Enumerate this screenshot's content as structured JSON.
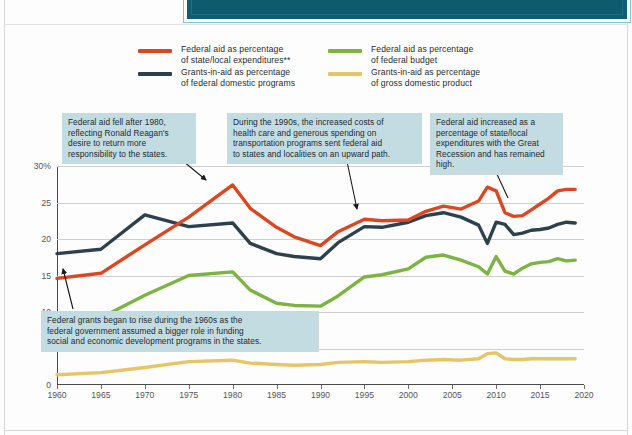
{
  "header": {
    "banner_text": "Figure • Federal aid to state and local governments, 1960-2020"
  },
  "legend": {
    "items": [
      {
        "name": "federal-aid-state-local",
        "label": "Federal aid as percentage\nof state/local expenditures**",
        "color": "#dc4620"
      },
      {
        "name": "federal-aid-federal-budget",
        "label": "Federal aid as percentage\nof federal budget",
        "color": "#7cb342"
      },
      {
        "name": "grants-in-aid-federal-domestic",
        "label": "Grants-in-aid as percentage\nof federal domestic programs",
        "color": "#2c404d"
      },
      {
        "name": "grants-in-aid-gdp",
        "label": "Grants-in-aid as percentage\nof gross domestic product",
        "color": "#e8c468"
      }
    ]
  },
  "annotations": {
    "reagan": "Federal aid fell after 1980,\nreflecting Ronald Reagan's\ndesire to return more\nresponsibility to the states.",
    "nineties": "During the 1990s, the increased costs of\nhealth care and generous spending on\ntransportation programs sent federal aid\nto states and localities on an upward path.",
    "recession": "Federal aid increased as a\npercentage of state/local\nexpenditures with the Great\nRecession and has remained high.",
    "sixties": "Federal grants began to rise during the 1960s as the\nfederal government assumed a bigger role in funding\nsocial and economic development programs in the states."
  },
  "chart_data": {
    "type": "line",
    "title": "",
    "xlabel": "",
    "ylabel": "",
    "xlim": [
      1960,
      2020
    ],
    "ylim": [
      0,
      30
    ],
    "grid": true,
    "legend_position": "top",
    "xticks": [
      1960,
      1965,
      1970,
      1975,
      1980,
      1985,
      1990,
      1995,
      2000,
      2005,
      2010,
      2015,
      2020
    ],
    "yticks": [
      0,
      5,
      10,
      15,
      20,
      25,
      30
    ],
    "ytick_labels": [
      "0",
      "5",
      "10",
      "15",
      "20",
      "25",
      "30%"
    ],
    "x": [
      1960,
      1965,
      1970,
      1975,
      1980,
      1982,
      1985,
      1987,
      1990,
      1992,
      1995,
      1997,
      2000,
      2002,
      2004,
      2006,
      2008,
      2009,
      2010,
      2011,
      2012,
      2013,
      2014,
      2015,
      2016,
      2017,
      2018,
      2019
    ],
    "series": [
      {
        "name": "Federal aid as percentage of state/local expenditures**",
        "color": "#dc4620",
        "values": [
          14.6,
          15.3,
          19.2,
          23.0,
          27.4,
          24.2,
          21.6,
          20.3,
          19.1,
          21.0,
          22.7,
          22.5,
          22.6,
          23.8,
          24.5,
          24.1,
          25.2,
          27.1,
          26.6,
          23.6,
          23.1,
          23.2,
          24.0,
          24.8,
          25.6,
          26.6,
          26.8,
          26.8
        ]
      },
      {
        "name": "Grants-in-aid as percentage of federal domestic programs",
        "color": "#2c404d",
        "values": [
          18.0,
          18.6,
          23.3,
          21.7,
          22.2,
          19.4,
          18.0,
          17.6,
          17.3,
          19.5,
          21.7,
          21.6,
          22.3,
          23.2,
          23.6,
          23.0,
          21.9,
          19.4,
          22.3,
          22.0,
          20.6,
          20.8,
          21.2,
          21.3,
          21.5,
          22.0,
          22.3,
          22.2
        ]
      },
      {
        "name": "Federal aid as percentage of federal budget",
        "color": "#7cb342",
        "values": [
          7.6,
          9.2,
          12.3,
          15.0,
          15.5,
          13.0,
          11.2,
          10.9,
          10.8,
          12.2,
          14.8,
          15.1,
          15.9,
          17.5,
          17.8,
          17.1,
          16.2,
          15.2,
          17.6,
          15.6,
          15.2,
          16.0,
          16.6,
          16.8,
          16.9,
          17.3,
          17.0,
          17.1
        ]
      },
      {
        "name": "Grants-in-aid as percentage of gross domestic product",
        "color": "#e8c468",
        "values": [
          1.4,
          1.7,
          2.4,
          3.2,
          3.4,
          3.0,
          2.8,
          2.7,
          2.8,
          3.1,
          3.2,
          3.1,
          3.2,
          3.4,
          3.5,
          3.4,
          3.6,
          4.3,
          4.4,
          3.6,
          3.5,
          3.5,
          3.6,
          3.6,
          3.6,
          3.6,
          3.6,
          3.6
        ]
      }
    ]
  }
}
